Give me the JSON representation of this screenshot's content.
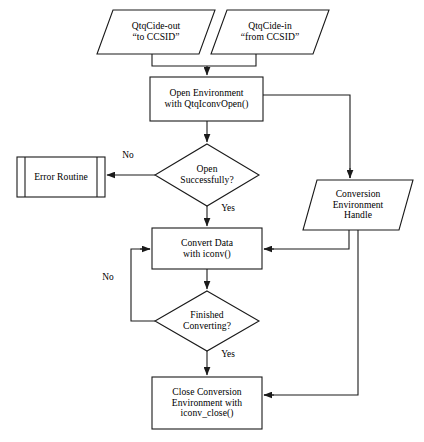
{
  "diagram": {
    "type": "flowchart",
    "background_color": "#ffffff",
    "stroke_color": "#1a1a1a",
    "text_color": "#000000",
    "nodes": [
      {
        "id": "qtqcide-out",
        "shape": "parallelogram",
        "role": "input",
        "lines": [
          "QtqCide-out",
          "“to CCSID”"
        ],
        "x": 97,
        "y": 10,
        "w": 118,
        "h": 44,
        "skew": 16
      },
      {
        "id": "qtqcide-in",
        "shape": "parallelogram",
        "role": "input",
        "lines": [
          "QtqCide-in",
          "“from CCSID”"
        ],
        "x": 211,
        "y": 10,
        "w": 118,
        "h": 44,
        "skew": 16
      },
      {
        "id": "open-environment",
        "shape": "rectangle",
        "role": "process",
        "lines": [
          "Open Environment",
          "with QtqIconvOpen()"
        ],
        "x": 150,
        "y": 77,
        "w": 113,
        "h": 44
      },
      {
        "id": "open-successfully",
        "shape": "diamond",
        "role": "decision",
        "lines": [
          "Open",
          "Successfully?"
        ],
        "x": 155,
        "y": 144,
        "w": 104,
        "h": 62
      },
      {
        "id": "error-routine",
        "shape": "predefined-process",
        "role": "subroutine",
        "lines": [
          "Error Routine"
        ],
        "x": 17,
        "y": 157,
        "w": 88,
        "h": 40
      },
      {
        "id": "conversion-environment-handle",
        "shape": "parallelogram",
        "role": "data",
        "lines": [
          "Conversion",
          "Environment",
          "Handle"
        ],
        "x": 303,
        "y": 180,
        "w": 110,
        "h": 50,
        "skew": 14
      },
      {
        "id": "convert-data",
        "shape": "rectangle",
        "role": "process",
        "lines": [
          "Convert Data",
          "with iconv()"
        ],
        "x": 152,
        "y": 228,
        "w": 110,
        "h": 41
      },
      {
        "id": "finished-converting",
        "shape": "diamond",
        "role": "decision",
        "lines": [
          "Finished",
          "Converting?"
        ],
        "x": 155,
        "y": 291,
        "w": 104,
        "h": 60
      },
      {
        "id": "close-conversion",
        "shape": "rectangle",
        "role": "process",
        "lines": [
          "Close Conversion",
          "Environment with",
          "iconv_close()"
        ],
        "x": 152,
        "y": 377,
        "w": 110,
        "h": 52
      }
    ],
    "edge_labels": [
      {
        "id": "no-open",
        "text": "No",
        "x": 118,
        "y": 150
      },
      {
        "id": "yes-open",
        "text": "Yes",
        "x": 216,
        "y": 203
      },
      {
        "id": "no-converting",
        "text": "No",
        "x": 98,
        "y": 272
      },
      {
        "id": "yes-converting",
        "text": "Yes",
        "x": 216,
        "y": 349
      }
    ],
    "edges": [
      {
        "from": "qtqcide-out",
        "to": "open-environment",
        "label": ""
      },
      {
        "from": "qtqcide-in",
        "to": "open-environment",
        "label": ""
      },
      {
        "from": "open-environment",
        "to": "open-successfully",
        "label": ""
      },
      {
        "from": "open-environment",
        "to": "conversion-environment-handle",
        "label": ""
      },
      {
        "from": "open-successfully",
        "to": "error-routine",
        "label": "No"
      },
      {
        "from": "open-successfully",
        "to": "convert-data",
        "label": "Yes"
      },
      {
        "from": "conversion-environment-handle",
        "to": "convert-data",
        "label": ""
      },
      {
        "from": "conversion-environment-handle",
        "to": "close-conversion",
        "label": ""
      },
      {
        "from": "convert-data",
        "to": "finished-converting",
        "label": ""
      },
      {
        "from": "finished-converting",
        "to": "convert-data",
        "label": "No"
      },
      {
        "from": "finished-converting",
        "to": "close-conversion",
        "label": "Yes"
      }
    ]
  }
}
